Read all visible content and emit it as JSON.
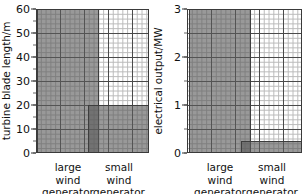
{
  "chart_data": [
    {
      "type": "bar",
      "id": "turbine-blade-length",
      "title": "",
      "xlabel": "",
      "ylabel": "turbine blade length/m",
      "ylim": [
        0,
        60
      ],
      "yticks": [
        0,
        10,
        20,
        30,
        40,
        50,
        60
      ],
      "ytick_labels": [
        "0",
        "10",
        "20",
        "30",
        "40",
        "50",
        "60"
      ],
      "minor_tick_step": 5,
      "grid": true,
      "grid_minor_step_y": 2,
      "grid_major_step_y": 10,
      "legend": "none",
      "categories": [
        "large wind generator",
        "small wind generator"
      ],
      "category_lines": [
        [
          "large",
          "wind",
          "generator"
        ],
        [
          "small",
          "wind",
          "generator"
        ]
      ],
      "values": [
        60,
        20
      ],
      "bar_color": "#5a5a5a"
    },
    {
      "type": "bar",
      "id": "electrical-output",
      "title": "",
      "xlabel": "",
      "ylabel": "electrical output/MW",
      "ylim": [
        0,
        3
      ],
      "yticks": [
        0,
        1,
        2,
        3
      ],
      "ytick_labels": [
        "0",
        "1",
        "2",
        "3"
      ],
      "minor_tick_step": 0.5,
      "grid": true,
      "grid_minor_step_y": 0.1,
      "grid_major_step_y": 0.5,
      "legend": "none",
      "categories": [
        "large wind generator",
        "small wind generator"
      ],
      "category_lines": [
        [
          "large",
          "wind",
          "generator"
        ],
        [
          "small",
          "wind",
          "generator"
        ]
      ],
      "values": [
        3,
        0.25
      ],
      "bar_color": "#5a5a5a"
    }
  ],
  "left_chart": {
    "ylabel": "turbine blade length/m",
    "ytick_labels": [
      "60",
      "50",
      "40",
      "30",
      "20",
      "10",
      "0"
    ],
    "cat1_line1": "large",
    "cat1_line2": "wind",
    "cat1_line3": "generator",
    "cat2_line1": "small",
    "cat2_line2": "wind",
    "cat2_line3": "generator"
  },
  "right_chart": {
    "ylabel": "electrical output/MW",
    "ytick_labels": [
      "3",
      "2",
      "1",
      "0"
    ],
    "cat1_line1": "large",
    "cat1_line2": "wind",
    "cat1_line3": "generator",
    "cat2_line1": "small",
    "cat2_line2": "wind",
    "cat2_line3": "generator"
  }
}
